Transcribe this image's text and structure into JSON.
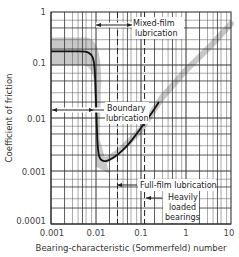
{
  "chart_data": {
    "type": "line",
    "title": "",
    "xlabel": "Bearing-characteristic (Sommerfeld) number",
    "ylabel": "Coefficient of friction",
    "xscale": "log",
    "yscale": "log",
    "xlim": [
      0.001,
      10
    ],
    "ylim": [
      0.0001,
      1
    ],
    "grid": true,
    "x_tick_labels": [
      "0.001",
      "0.01",
      "0.1",
      "1",
      "10"
    ],
    "y_tick_labels": [
      "1",
      "0.1",
      "0.01",
      "0.001",
      "0.0001"
    ],
    "series": [
      {
        "name": "Friction coefficient (Stribeck curve)",
        "style": "solid black line",
        "x": [
          0.001,
          0.003,
          0.006,
          0.008,
          0.009,
          0.0095,
          0.01,
          0.0105,
          0.011,
          0.012,
          0.015,
          0.02,
          0.03,
          0.05,
          0.08,
          0.12,
          0.18,
          0.25
        ],
        "y": [
          0.18,
          0.18,
          0.18,
          0.16,
          0.12,
          0.07,
          0.02,
          0.006,
          0.0025,
          0.0017,
          0.0015,
          0.0016,
          0.002,
          0.003,
          0.005,
          0.008,
          0.013,
          0.02
        ]
      },
      {
        "name": "Scatter band (shaded)",
        "style": "gray band",
        "x": [
          0.001,
          0.01,
          0.015,
          0.03,
          0.1,
          0.3,
          1,
          3,
          10
        ],
        "y": [
          0.18,
          0.05,
          0.0015,
          0.0022,
          0.006,
          0.025,
          0.08,
          0.2,
          0.6
        ]
      }
    ],
    "annotations": [
      {
        "text": "Mixed-film lubrication",
        "arrow_span_x": [
          0.01,
          0.03
        ]
      },
      {
        "text": "Boundary lubrication",
        "arrow_span_x": [
          0.001,
          0.01
        ]
      },
      {
        "text": "Full-film lubrication",
        "arrow_from_x": 0.03
      },
      {
        "text": "Heavily loaded bearings",
        "arrow_from_x": 0.12
      }
    ],
    "dashed_lines_x": [
      0.03,
      0.12
    ]
  },
  "labels": {
    "ylabel": "Coefficient of friction",
    "xlabel": "Bearing-characteristic (Sommerfeld) number",
    "mixed_1": "Mixed-film",
    "mixed_2": "lubrication",
    "boundary_1": "Boundary",
    "boundary_2": "lubrication",
    "fullfilm": "Full-film lubrication",
    "heavy_1": "Heavily",
    "heavy_2": "loaded",
    "heavy_3": "bearings",
    "xt0": "0.001",
    "xt1": "0.01",
    "xt2": "0.1",
    "xt3": "1",
    "xt4": "10",
    "yt0": "1",
    "yt1": "0.1",
    "yt2": "0.01",
    "yt3": "0.001",
    "yt4": "0.0001"
  },
  "colors": {
    "curve": "#111111",
    "band": "#c8c8c8",
    "grid": "#333333",
    "text": "#333333"
  }
}
